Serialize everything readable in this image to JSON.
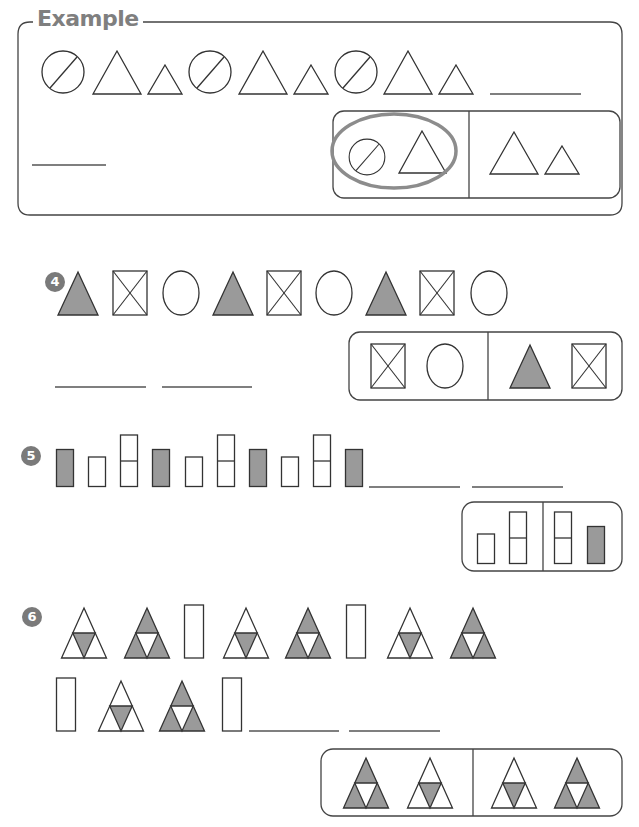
{
  "example": {
    "label": "Example",
    "sequence": [
      "circle-slash",
      "triangle-large",
      "triangle-small",
      "circle-slash",
      "triangle-large",
      "triangle-small",
      "circle-slash",
      "triangle-large",
      "triangle-small"
    ],
    "blanks": 2,
    "answer_choices": [
      {
        "shapes": [
          "circle-slash",
          "triangle-large"
        ],
        "selected": true
      },
      {
        "shapes": [
          "triangle-large",
          "triangle-small"
        ],
        "selected": false
      }
    ]
  },
  "questions": [
    {
      "number": "4",
      "sequence": [
        "triangle-filled",
        "square-x",
        "circle",
        "triangle-filled",
        "square-x",
        "circle",
        "triangle-filled",
        "square-x",
        "circle"
      ],
      "blanks": 2,
      "answer_choices": [
        {
          "shapes": [
            "square-x",
            "circle"
          ],
          "selected": false
        },
        {
          "shapes": [
            "triangle-filled",
            "square-x"
          ],
          "selected": false
        }
      ]
    },
    {
      "number": "5",
      "sequence": [
        "rect-filled",
        "rect-short",
        "rect-tall-split",
        "rect-filled",
        "rect-short",
        "rect-tall-split",
        "rect-filled",
        "rect-short",
        "rect-tall-split",
        "rect-filled"
      ],
      "blanks": 2,
      "answer_choices": [
        {
          "shapes": [
            "rect-short",
            "rect-tall-split"
          ],
          "selected": false
        },
        {
          "shapes": [
            "rect-tall-split",
            "rect-filled"
          ],
          "selected": false
        }
      ]
    },
    {
      "number": "6",
      "sequence": [
        "tri-center-filled",
        "tri-corners-filled",
        "rect-tall",
        "tri-center-filled",
        "tri-corners-filled",
        "rect-tall",
        "tri-center-filled",
        "tri-corners-filled",
        "rect-tall",
        "tri-center-filled",
        "tri-corners-filled",
        "rect-tall"
      ],
      "blanks": 2,
      "answer_choices": [
        {
          "shapes": [
            "tri-corners-filled",
            "tri-center-filled"
          ],
          "selected": false
        },
        {
          "shapes": [
            "tri-center-filled",
            "tri-corners-filled"
          ],
          "selected": false
        }
      ]
    }
  ],
  "colors": {
    "stroke": "#333333",
    "fill_gray": "#9a9a9a",
    "selection_ring": "#8c8c8c",
    "badge": "#7a7a7a",
    "label_gray": "#7f7f7f"
  }
}
